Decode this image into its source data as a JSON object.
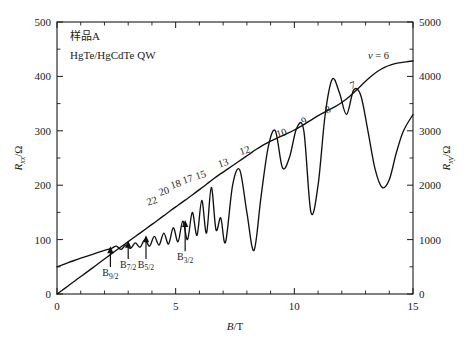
{
  "chart_data": {
    "type": "line",
    "title": "",
    "annotations_text": [
      "样品A",
      "HgTe/HgCdTe  QW"
    ],
    "xlabel": "B/T",
    "ylabel_left": "R_xx/Ω",
    "ylabel_right": "R_xy/Ω",
    "xlim": [
      0,
      15
    ],
    "ylim_left": [
      0,
      500
    ],
    "ylim_right": [
      0,
      5000
    ],
    "xticks": [
      0,
      5,
      10,
      15
    ],
    "xticklabels": [
      "0",
      "5",
      "10",
      "15"
    ],
    "xminorticks": [
      1,
      2,
      3,
      4,
      6,
      7,
      8,
      9,
      11,
      12,
      13,
      14
    ],
    "yticks_left": [
      0,
      100,
      200,
      300,
      400,
      500
    ],
    "yticklabels_left": [
      "0",
      "100",
      "200",
      "300",
      "400",
      "500"
    ],
    "yminorticks_left": [
      50,
      150,
      250,
      350,
      450
    ],
    "yticks_right": [
      0,
      1000,
      2000,
      3000,
      4000,
      5000
    ],
    "yticklabels_right": [
      "0",
      "1000",
      "2000",
      "3000",
      "4000",
      "5000"
    ],
    "yminorticks_right": [
      500,
      1500,
      2500,
      3500,
      4500
    ],
    "grid": false,
    "legend": "none",
    "series": [
      {
        "name": "R_xy",
        "axis": "right",
        "description": "Hall resistance with quantum Hall plateaus",
        "x": [
          0.0,
          0.3,
          0.6,
          0.9,
          1.2,
          1.5,
          1.8,
          2.1,
          2.4,
          2.7,
          3.0,
          3.3,
          3.6,
          3.9,
          4.2,
          4.5,
          4.8,
          5.1,
          5.4,
          5.7,
          6.0,
          6.3,
          6.6,
          6.9,
          7.2,
          7.5,
          7.8,
          8.1,
          8.4,
          8.7,
          9.0,
          9.3,
          9.6,
          9.9,
          10.2,
          10.5,
          10.8,
          11.1,
          11.4,
          11.7,
          12.0,
          12.3,
          12.6,
          12.9,
          13.2,
          13.5,
          13.8,
          14.1,
          14.4,
          14.7,
          15.0
        ],
        "y": [
          0,
          95,
          192,
          288,
          384,
          480,
          578,
          675,
          772,
          868,
          962,
          1058,
          1152,
          1248,
          1342,
          1440,
          1538,
          1632,
          1726,
          1820,
          1918,
          2018,
          2118,
          2212,
          2300,
          2390,
          2480,
          2570,
          2660,
          2742,
          2812,
          2872,
          2930,
          2992,
          3062,
          3140,
          3225,
          3302,
          3372,
          3440,
          3520,
          3620,
          3740,
          3870,
          3990,
          4090,
          4165,
          4215,
          4248,
          4268,
          4285
        ]
      },
      {
        "name": "R_xx",
        "axis": "left",
        "description": "Shubnikov-de Haas oscillations of longitudinal resistance",
        "x": [
          0.0,
          0.5,
          1.0,
          1.5,
          2.0,
          2.3,
          2.5,
          2.7,
          2.9,
          3.1,
          3.3,
          3.5,
          3.7,
          3.9,
          4.1,
          4.3,
          4.5,
          4.7,
          4.9,
          5.1,
          5.3,
          5.5,
          5.7,
          5.9,
          6.1,
          6.3,
          6.5,
          6.7,
          6.9,
          7.1,
          7.4,
          7.7,
          8.0,
          8.3,
          8.6,
          8.9,
          9.2,
          9.5,
          9.8,
          10.1,
          10.4,
          10.7,
          11.0,
          11.3,
          11.6,
          11.9,
          12.2,
          12.5,
          12.8,
          13.1,
          13.4,
          13.7,
          14.0,
          14.3,
          14.6,
          15.0
        ],
        "y": [
          50,
          58,
          66,
          73,
          80,
          84,
          88,
          82,
          90,
          84,
          94,
          86,
          100,
          88,
          106,
          90,
          112,
          92,
          122,
          96,
          134,
          100,
          150,
          108,
          172,
          112,
          196,
          118,
          140,
          95,
          200,
          228,
          150,
          80,
          180,
          270,
          300,
          232,
          252,
          305,
          300,
          150,
          200,
          330,
          395,
          370,
          330,
          375,
          365,
          300,
          230,
          196,
          210,
          260,
          300,
          330
        ]
      }
    ],
    "filling_factors": [
      {
        "label": "22",
        "x": 4.05,
        "y": 165
      },
      {
        "label": "20",
        "x": 4.55,
        "y": 183
      },
      {
        "label": "18",
        "x": 5.05,
        "y": 196
      },
      {
        "label": "17",
        "x": 5.55,
        "y": 205
      },
      {
        "label": "15",
        "x": 6.1,
        "y": 213
      },
      {
        "label": "13",
        "x": 7.05,
        "y": 235
      },
      {
        "label": "12",
        "x": 7.95,
        "y": 258
      },
      {
        "label": "10",
        "x": 9.5,
        "y": 290
      },
      {
        "label": "9",
        "x": 10.45,
        "y": 312
      },
      {
        "label": "8",
        "x": 11.45,
        "y": 333
      },
      {
        "label": "7",
        "x": 12.5,
        "y": 378
      }
    ],
    "nu_label": "v = 6",
    "nu_label_x": 13.55,
    "nu_label_y": 432,
    "field_markers": [
      {
        "label": "B",
        "sub": "9/2",
        "x": 2.25,
        "tip_y": 88,
        "text_y": 33
      },
      {
        "label": "B",
        "sub": "7/2",
        "x": 3.0,
        "tip_y": 98,
        "text_y": 48
      },
      {
        "label": "B",
        "sub": "5/2",
        "x": 3.75,
        "tip_y": 108,
        "text_y": 48
      },
      {
        "label": "B",
        "sub": "3/2",
        "x": 5.4,
        "tip_y": 136,
        "text_y": 62
      }
    ]
  }
}
